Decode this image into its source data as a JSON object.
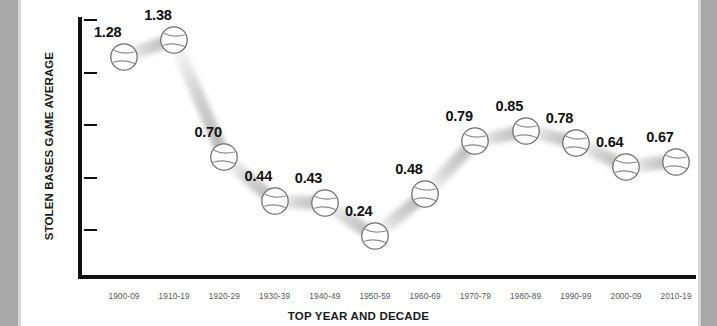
{
  "chart_data": {
    "type": "scatter",
    "title": "",
    "xlabel": "TOP YEAR AND DECADE",
    "ylabel": "STOLEN BASES GAME AVERAGE",
    "categories": [
      "1900-09",
      "1910-19",
      "1920-29",
      "1930-39",
      "1940-49",
      "1950-59",
      "1960-69",
      "1970-79",
      "1980-89",
      "1990-99",
      "2000-09",
      "2010-19"
    ],
    "values": [
      1.28,
      1.38,
      0.7,
      0.44,
      0.43,
      0.24,
      0.48,
      0.79,
      0.85,
      0.78,
      0.64,
      0.67
    ],
    "value_labels": [
      "1.28",
      "1.38",
      "0.70",
      "0.44",
      "0.43",
      "0.24",
      "0.48",
      "0.79",
      "0.85",
      "0.78",
      "0.64",
      "0.67"
    ],
    "marker": "baseball-icon",
    "ylim": [
      0,
      1.5
    ],
    "y_ticks": [
      "",
      "",
      "",
      "",
      ""
    ],
    "grid": false,
    "legend": null
  },
  "axes": {
    "y_title": "STOLEN BASES GAME AVERAGE",
    "x_title": "TOP YEAR AND DECADE"
  },
  "colors": {
    "axis": "#111111",
    "label_text": "#111111",
    "tick_text": "#58585a",
    "edge_band": "#a8a8a8",
    "background": "#ffffff"
  }
}
